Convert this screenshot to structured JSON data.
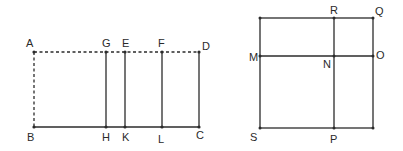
{
  "figures": {
    "left": {
      "description": "Rectangle ABCD with dashed top edge AD and dashed left edge AB; vertical segments GH, EK, FL inside",
      "points": {
        "A": {
          "label": "A",
          "x": 34,
          "y": 52
        },
        "G": {
          "label": "G",
          "x": 106,
          "y": 52
        },
        "E": {
          "label": "E",
          "x": 125,
          "y": 52
        },
        "F": {
          "label": "F",
          "x": 162,
          "y": 52
        },
        "D": {
          "label": "D",
          "x": 199,
          "y": 52
        },
        "B": {
          "label": "B",
          "x": 34,
          "y": 127
        },
        "H": {
          "label": "H",
          "x": 106,
          "y": 127
        },
        "K": {
          "label": "K",
          "x": 125,
          "y": 127
        },
        "L": {
          "label": "L",
          "x": 162,
          "y": 127
        },
        "C": {
          "label": "C",
          "x": 199,
          "y": 127
        }
      }
    },
    "right": {
      "description": "Square SPQ-corner figure with segment MO horizontal and RP vertical intersecting at N",
      "points": {
        "TL": {
          "label": "",
          "x": 260,
          "y": 18
        },
        "R": {
          "label": "R",
          "x": 334,
          "y": 18
        },
        "Q": {
          "label": "Q",
          "x": 373,
          "y": 18
        },
        "M": {
          "label": "M",
          "x": 260,
          "y": 56
        },
        "N": {
          "label": "N",
          "x": 334,
          "y": 56
        },
        "O": {
          "label": "O",
          "x": 373,
          "y": 56
        },
        "S": {
          "label": "S",
          "x": 260,
          "y": 128
        },
        "P": {
          "label": "P",
          "x": 334,
          "y": 128
        },
        "BR": {
          "label": "",
          "x": 373,
          "y": 128
        }
      }
    }
  },
  "colors": {
    "line": "#2b2b2b",
    "text": "#2a2a2a",
    "background": "#ffffff"
  }
}
